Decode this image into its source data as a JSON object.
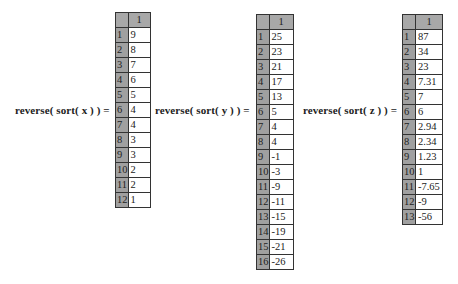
{
  "expressions": [
    {
      "label_func": "reverse( sort( ",
      "label_arg": "x",
      "label_close": " ) ) =",
      "column_header": "1",
      "rows": [
        {
          "index": "1",
          "value": "9"
        },
        {
          "index": "2",
          "value": "8"
        },
        {
          "index": "3",
          "value": "7"
        },
        {
          "index": "4",
          "value": "6"
        },
        {
          "index": "5",
          "value": "5"
        },
        {
          "index": "6",
          "value": "4"
        },
        {
          "index": "7",
          "value": "4"
        },
        {
          "index": "8",
          "value": "3"
        },
        {
          "index": "9",
          "value": "3"
        },
        {
          "index": "10",
          "value": "2"
        },
        {
          "index": "11",
          "value": "2"
        },
        {
          "index": "12",
          "value": "1"
        }
      ]
    },
    {
      "label_func": "reverse( sort( ",
      "label_arg": "y",
      "label_close": " ) ) =",
      "column_header": "1",
      "rows": [
        {
          "index": "1",
          "value": "25"
        },
        {
          "index": "2",
          "value": "23"
        },
        {
          "index": "3",
          "value": "21"
        },
        {
          "index": "4",
          "value": "17"
        },
        {
          "index": "5",
          "value": "13"
        },
        {
          "index": "6",
          "value": "5"
        },
        {
          "index": "7",
          "value": "4"
        },
        {
          "index": "8",
          "value": "4"
        },
        {
          "index": "9",
          "value": "-1"
        },
        {
          "index": "10",
          "value": "-3"
        },
        {
          "index": "11",
          "value": "-9"
        },
        {
          "index": "12",
          "value": "-11"
        },
        {
          "index": "13",
          "value": "-15"
        },
        {
          "index": "14",
          "value": "-19"
        },
        {
          "index": "15",
          "value": "-21"
        },
        {
          "index": "16",
          "value": "-26"
        }
      ]
    },
    {
      "label_func": "reverse( sort( ",
      "label_arg": "z",
      "label_close": " ) ) =",
      "column_header": "1",
      "rows": [
        {
          "index": "1",
          "value": "87"
        },
        {
          "index": "2",
          "value": "34"
        },
        {
          "index": "3",
          "value": "23"
        },
        {
          "index": "4",
          "value": "7.31"
        },
        {
          "index": "5",
          "value": "7"
        },
        {
          "index": "6",
          "value": "6"
        },
        {
          "index": "7",
          "value": "2.94"
        },
        {
          "index": "8",
          "value": "2.34"
        },
        {
          "index": "9",
          "value": "1.23"
        },
        {
          "index": "10",
          "value": "1"
        },
        {
          "index": "11",
          "value": "-7.65"
        },
        {
          "index": "12",
          "value": "-9"
        },
        {
          "index": "13",
          "value": "-56"
        }
      ]
    }
  ]
}
